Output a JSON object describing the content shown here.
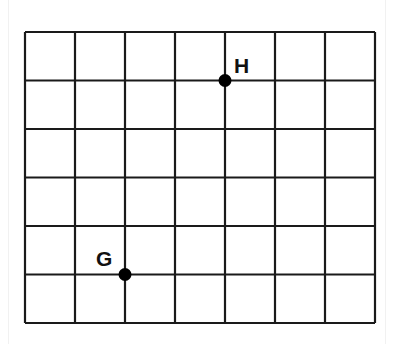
{
  "diagram": {
    "type": "coordinate-grid",
    "columns": 7,
    "rows": 6,
    "grid_color": "#1a1a1a",
    "points": [
      {
        "label": "H",
        "col": 4,
        "row": 1
      },
      {
        "label": "G",
        "col": 2,
        "row": 5
      }
    ]
  }
}
